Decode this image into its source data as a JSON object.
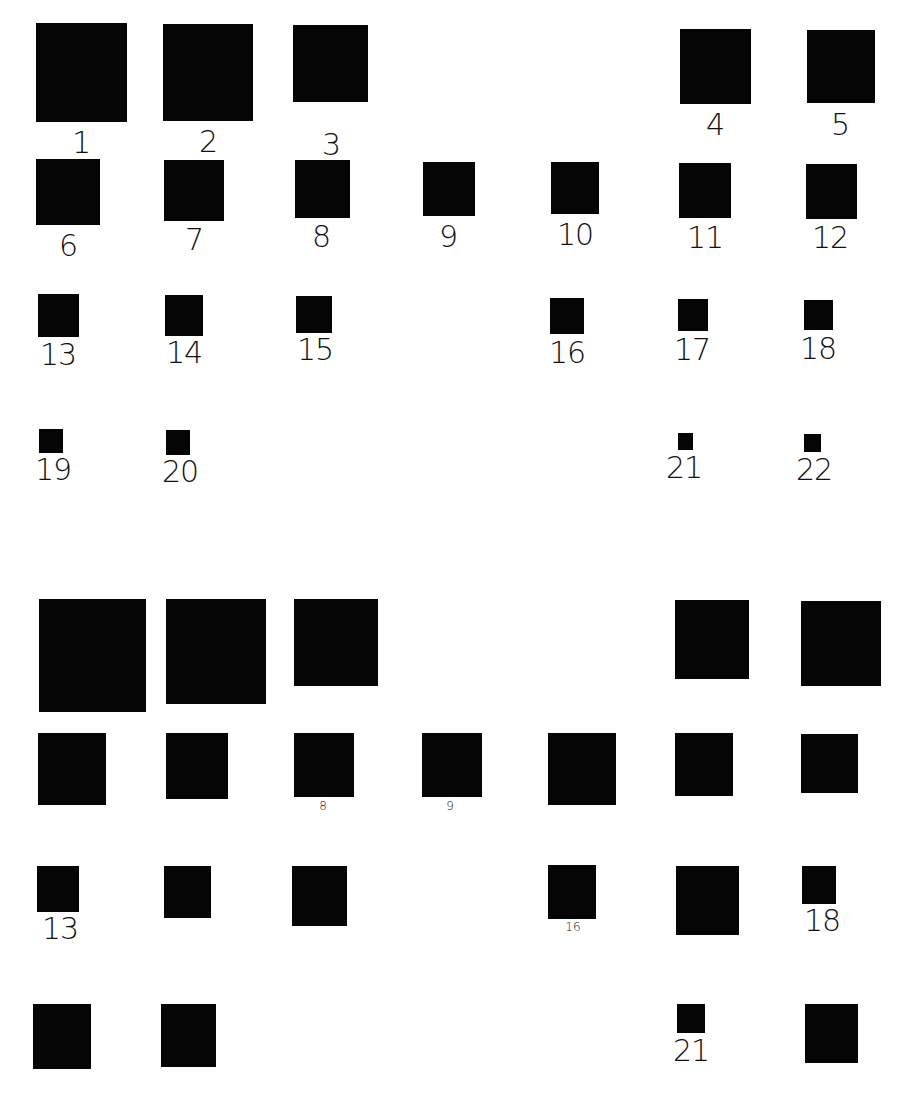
{
  "colors": {
    "background": "#ffffff",
    "square": "#050505",
    "label": "#111111"
  },
  "panels": [
    {
      "name": "top-panel",
      "items": [
        {
          "id": "1",
          "x": 36,
          "y": 23,
          "w": 91,
          "h": 99,
          "label": "1",
          "lx": 81,
          "ly": 128,
          "size": "big"
        },
        {
          "id": "2",
          "x": 163,
          "y": 24,
          "w": 90,
          "h": 97,
          "label": "2",
          "lx": 208,
          "ly": 127,
          "size": "big"
        },
        {
          "id": "3",
          "x": 293,
          "y": 25,
          "w": 75,
          "h": 77,
          "label": "3",
          "lx": 331,
          "ly": 130,
          "size": "big"
        },
        {
          "id": "4",
          "x": 680,
          "y": 29,
          "w": 71,
          "h": 75,
          "label": "4",
          "lx": 715,
          "ly": 110,
          "size": "big"
        },
        {
          "id": "5",
          "x": 807,
          "y": 30,
          "w": 68,
          "h": 73,
          "label": "5",
          "lx": 840,
          "ly": 110,
          "size": "big"
        },
        {
          "id": "6",
          "x": 36,
          "y": 159,
          "w": 64,
          "h": 66,
          "label": "6",
          "lx": 68,
          "ly": 231,
          "size": "big"
        },
        {
          "id": "7",
          "x": 164,
          "y": 160,
          "w": 60,
          "h": 61,
          "label": "7",
          "lx": 194,
          "ly": 225,
          "size": "big"
        },
        {
          "id": "8",
          "x": 295,
          "y": 160,
          "w": 55,
          "h": 58,
          "label": "8",
          "lx": 321,
          "ly": 222,
          "size": "big"
        },
        {
          "id": "9",
          "x": 423,
          "y": 162,
          "w": 52,
          "h": 54,
          "label": "9",
          "lx": 448,
          "ly": 222,
          "size": "big"
        },
        {
          "id": "10",
          "x": 551,
          "y": 162,
          "w": 48,
          "h": 52,
          "label": "10",
          "lx": 575,
          "ly": 220,
          "size": "big"
        },
        {
          "id": "11",
          "x": 679,
          "y": 163,
          "w": 52,
          "h": 55,
          "label": "11",
          "lx": 705,
          "ly": 223,
          "size": "big"
        },
        {
          "id": "12",
          "x": 806,
          "y": 164,
          "w": 51,
          "h": 55,
          "label": "12",
          "lx": 830,
          "ly": 223,
          "size": "big"
        },
        {
          "id": "13",
          "x": 38,
          "y": 294,
          "w": 41,
          "h": 43,
          "label": "13",
          "lx": 58,
          "ly": 340,
          "size": "big"
        },
        {
          "id": "14",
          "x": 165,
          "y": 295,
          "w": 38,
          "h": 41,
          "label": "14",
          "lx": 184,
          "ly": 338,
          "size": "big"
        },
        {
          "id": "15",
          "x": 296,
          "y": 296,
          "w": 36,
          "h": 37,
          "label": "15",
          "lx": 315,
          "ly": 335,
          "size": "big"
        },
        {
          "id": "16",
          "x": 550,
          "y": 298,
          "w": 34,
          "h": 36,
          "label": "16",
          "lx": 567,
          "ly": 338,
          "size": "big"
        },
        {
          "id": "17",
          "x": 678,
          "y": 299,
          "w": 30,
          "h": 32,
          "label": "17",
          "lx": 692,
          "ly": 335,
          "size": "big"
        },
        {
          "id": "18",
          "x": 804,
          "y": 300,
          "w": 29,
          "h": 30,
          "label": "18",
          "lx": 818,
          "ly": 334,
          "size": "big"
        },
        {
          "id": "19",
          "x": 39,
          "y": 429,
          "w": 24,
          "h": 24,
          "label": "19",
          "lx": 53,
          "ly": 455,
          "size": "big"
        },
        {
          "id": "20",
          "x": 166,
          "y": 430,
          "w": 24,
          "h": 25,
          "label": "20",
          "lx": 180,
          "ly": 457,
          "size": "big"
        },
        {
          "id": "21",
          "x": 678,
          "y": 433,
          "w": 15,
          "h": 17,
          "label": "21",
          "lx": 684,
          "ly": 453,
          "size": "big"
        },
        {
          "id": "22",
          "x": 804,
          "y": 434,
          "w": 17,
          "h": 18,
          "label": "22",
          "lx": 814,
          "ly": 455,
          "size": "big"
        }
      ]
    },
    {
      "name": "bottom-panel",
      "items": [
        {
          "id": "1",
          "x": 39,
          "y": 599,
          "w": 107,
          "h": 113,
          "label": "",
          "size": "big"
        },
        {
          "id": "2",
          "x": 166,
          "y": 599,
          "w": 100,
          "h": 105,
          "label": "",
          "size": "big"
        },
        {
          "id": "3",
          "x": 294,
          "y": 599,
          "w": 84,
          "h": 87,
          "label": "",
          "size": "big"
        },
        {
          "id": "4",
          "x": 675,
          "y": 600,
          "w": 74,
          "h": 79,
          "label": "",
          "size": "big"
        },
        {
          "id": "5",
          "x": 801,
          "y": 601,
          "w": 80,
          "h": 85,
          "label": "",
          "size": "big"
        },
        {
          "id": "6",
          "x": 38,
          "y": 733,
          "w": 68,
          "h": 72,
          "label": "",
          "size": "big"
        },
        {
          "id": "7",
          "x": 166,
          "y": 733,
          "w": 62,
          "h": 66,
          "label": "",
          "size": "big"
        },
        {
          "id": "8",
          "x": 294,
          "y": 733,
          "w": 60,
          "h": 64,
          "label": "8",
          "lx": 323,
          "ly": 800,
          "size": "small"
        },
        {
          "id": "9",
          "x": 422,
          "y": 733,
          "w": 60,
          "h": 64,
          "label": "9",
          "lx": 450,
          "ly": 800,
          "size": "small"
        },
        {
          "id": "10",
          "x": 548,
          "y": 733,
          "w": 68,
          "h": 72,
          "label": "",
          "size": "big"
        },
        {
          "id": "11",
          "x": 675,
          "y": 733,
          "w": 58,
          "h": 63,
          "label": "",
          "size": "big"
        },
        {
          "id": "12",
          "x": 801,
          "y": 734,
          "w": 57,
          "h": 59,
          "label": "",
          "size": "big"
        },
        {
          "id": "13",
          "x": 37,
          "y": 866,
          "w": 42,
          "h": 46,
          "label": "13",
          "lx": 60,
          "ly": 914,
          "size": "big"
        },
        {
          "id": "14",
          "x": 164,
          "y": 866,
          "w": 47,
          "h": 52,
          "label": "",
          "size": "big"
        },
        {
          "id": "15",
          "x": 292,
          "y": 866,
          "w": 55,
          "h": 60,
          "label": "",
          "size": "big"
        },
        {
          "id": "16",
          "x": 548,
          "y": 865,
          "w": 48,
          "h": 54,
          "label": "16",
          "lx": 573,
          "ly": 921,
          "size": "small"
        },
        {
          "id": "17",
          "x": 676,
          "y": 866,
          "w": 63,
          "h": 69,
          "label": "",
          "size": "big"
        },
        {
          "id": "18",
          "x": 802,
          "y": 866,
          "w": 34,
          "h": 38,
          "label": "18",
          "lx": 822,
          "ly": 906,
          "size": "big"
        },
        {
          "id": "19",
          "x": 33,
          "y": 1004,
          "w": 58,
          "h": 65,
          "label": "",
          "size": "big"
        },
        {
          "id": "20",
          "x": 161,
          "y": 1004,
          "w": 55,
          "h": 63,
          "label": "",
          "size": "big"
        },
        {
          "id": "21",
          "x": 677,
          "y": 1004,
          "w": 28,
          "h": 29,
          "label": "21",
          "lx": 691,
          "ly": 1036,
          "size": "big"
        },
        {
          "id": "22",
          "x": 805,
          "y": 1004,
          "w": 53,
          "h": 59,
          "label": "",
          "size": "big"
        }
      ]
    }
  ]
}
